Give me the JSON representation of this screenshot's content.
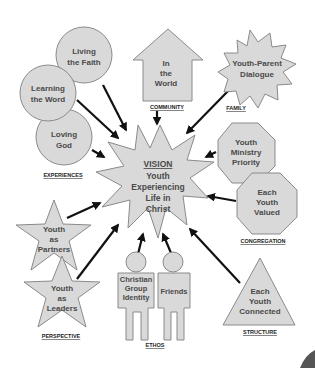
{
  "diagram": {
    "center": {
      "title": "VISION",
      "lines": [
        "Youth",
        "Experiencing",
        "Life in",
        "Christ"
      ]
    },
    "groups": [
      {
        "caption": "EXPERIENCES",
        "nodes": [
          {
            "shape": "circle",
            "lines": [
              "Living",
              "the Faith"
            ]
          },
          {
            "shape": "circle",
            "lines": [
              "Learning",
              "the Word"
            ]
          },
          {
            "shape": "circle",
            "lines": [
              "Loving",
              "God"
            ]
          }
        ]
      },
      {
        "caption": "COMMUNITY",
        "nodes": [
          {
            "shape": "house",
            "lines": [
              "In",
              "the",
              "World"
            ]
          }
        ]
      },
      {
        "caption": "FAMILY",
        "nodes": [
          {
            "shape": "starburst",
            "lines": [
              "Youth-Parent",
              "Dialogue"
            ]
          }
        ]
      },
      {
        "caption": "CONGREGATION",
        "nodes": [
          {
            "shape": "octagon",
            "lines": [
              "Youth",
              "Ministry",
              "Priority"
            ]
          },
          {
            "shape": "octagon",
            "lines": [
              "Each",
              "Youth",
              "Valued"
            ]
          }
        ]
      },
      {
        "caption": "PERSPECTIVE",
        "nodes": [
          {
            "shape": "star",
            "lines": [
              "Youth",
              "as",
              "Partners"
            ]
          },
          {
            "shape": "star",
            "lines": [
              "Youth",
              "as",
              "Leaders"
            ]
          }
        ]
      },
      {
        "caption": "ETHOS",
        "nodes": [
          {
            "shape": "person",
            "lines": [
              "Christian",
              "Group",
              "Identity"
            ]
          },
          {
            "shape": "person",
            "lines": [
              "Friends"
            ]
          }
        ]
      },
      {
        "caption": "STRUCTURE",
        "nodes": [
          {
            "shape": "triangle",
            "lines": [
              "Each",
              "Youth",
              "Connected"
            ]
          }
        ]
      }
    ]
  },
  "colors": {
    "shape_fill": "#d9d9d9",
    "shape_stroke": "#8a8a8a",
    "text": "#4a4a4a",
    "arrow": "#111111"
  }
}
